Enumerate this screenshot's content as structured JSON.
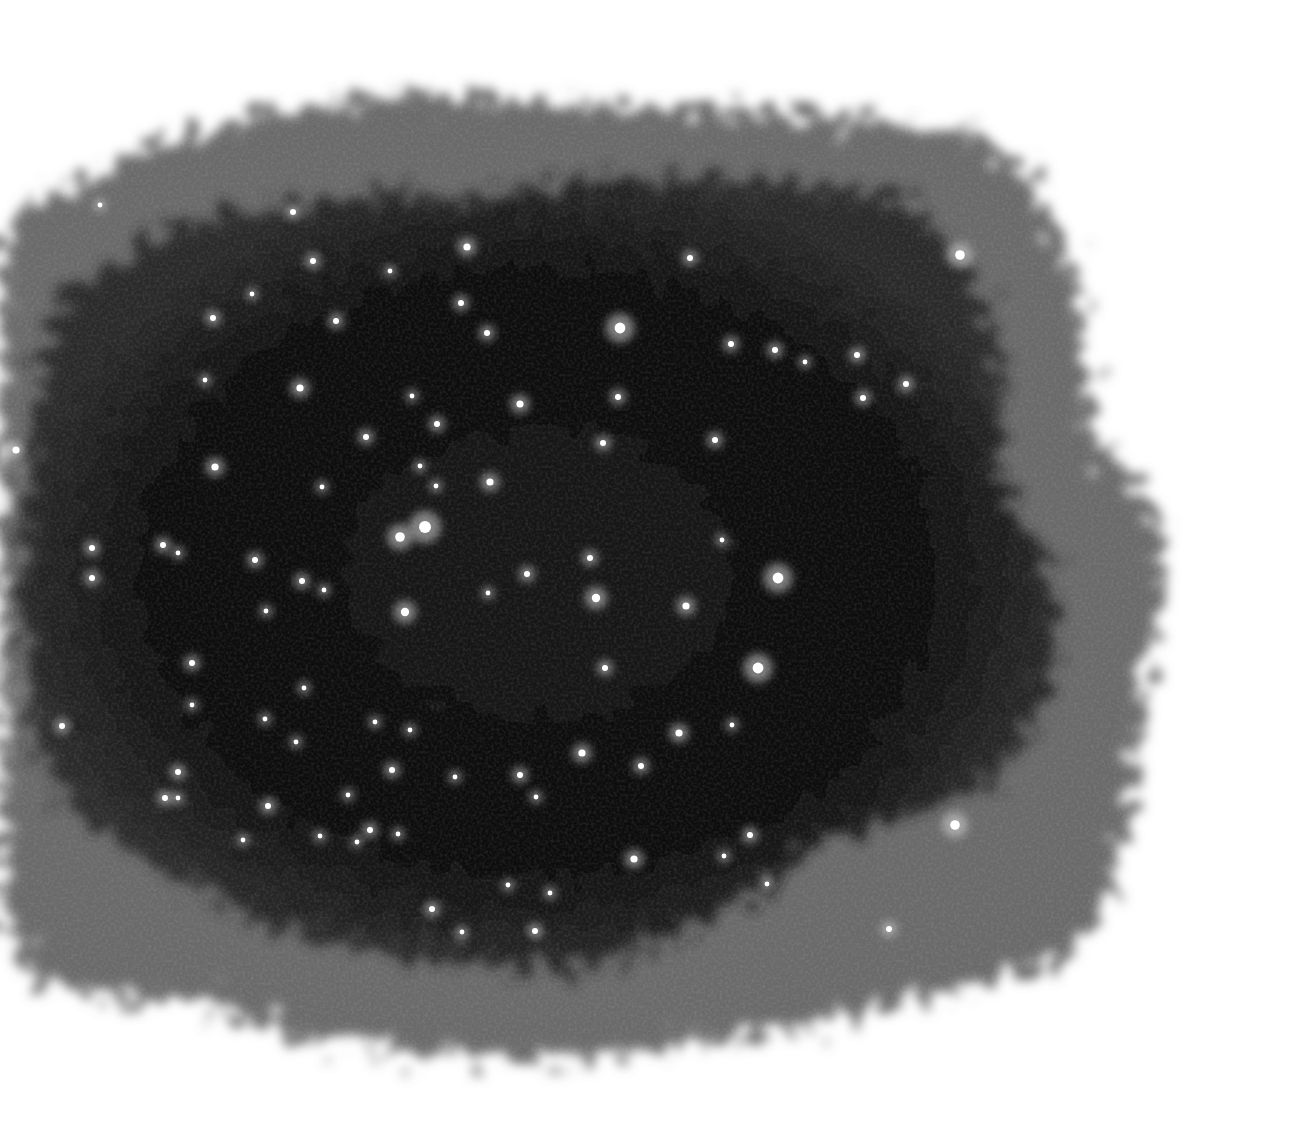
{
  "image": {
    "description": "Grayscale star field on a dark irregular patch with noisy feathered edges against white background",
    "background": "#ffffff",
    "field_color": "#0a0a0a",
    "edge_color": "#5a5a5a",
    "stars": [
      [
        620,
        328,
        9
      ],
      [
        690,
        258,
        5
      ],
      [
        960,
        255,
        8
      ],
      [
        778,
        578,
        9
      ],
      [
        758,
        668,
        9
      ],
      [
        955,
        825,
        8
      ],
      [
        425,
        527,
        10
      ],
      [
        400,
        537,
        8
      ],
      [
        405,
        612,
        7
      ],
      [
        596,
        598,
        7
      ],
      [
        686,
        606,
        6
      ],
      [
        582,
        753,
        6
      ],
      [
        520,
        404,
        6
      ],
      [
        437,
        424,
        5
      ],
      [
        412,
        396,
        4
      ],
      [
        366,
        437,
        5
      ],
      [
        300,
        388,
        6
      ],
      [
        215,
        467,
        6
      ],
      [
        213,
        318,
        5
      ],
      [
        313,
        261,
        5
      ],
      [
        336,
        321,
        5
      ],
      [
        252,
        294,
        4
      ],
      [
        390,
        271,
        4
      ],
      [
        293,
        212,
        5
      ],
      [
        467,
        247,
        6
      ],
      [
        461,
        303,
        5
      ],
      [
        487,
        333,
        5
      ],
      [
        490,
        482,
        6
      ],
      [
        436,
        486,
        4
      ],
      [
        420,
        466,
        4
      ],
      [
        322,
        487,
        4
      ],
      [
        163,
        545,
        5
      ],
      [
        178,
        553,
        4
      ],
      [
        92,
        548,
        5
      ],
      [
        92,
        578,
        5
      ],
      [
        255,
        560,
        5
      ],
      [
        302,
        581,
        5
      ],
      [
        324,
        590,
        4
      ],
      [
        266,
        611,
        4
      ],
      [
        192,
        663,
        5
      ],
      [
        192,
        705,
        4
      ],
      [
        304,
        688,
        4
      ],
      [
        265,
        719,
        4
      ],
      [
        296,
        742,
        4
      ],
      [
        62,
        726,
        5
      ],
      [
        178,
        772,
        5
      ],
      [
        165,
        798,
        5
      ],
      [
        178,
        798,
        4
      ],
      [
        268,
        806,
        5
      ],
      [
        243,
        840,
        4
      ],
      [
        320,
        836,
        4
      ],
      [
        370,
        830,
        5
      ],
      [
        357,
        842,
        4
      ],
      [
        398,
        834,
        4
      ],
      [
        392,
        770,
        5
      ],
      [
        410,
        730,
        4
      ],
      [
        375,
        722,
        4
      ],
      [
        348,
        795,
        4
      ],
      [
        455,
        777,
        4
      ],
      [
        520,
        775,
        5
      ],
      [
        536,
        797,
        4
      ],
      [
        527,
        574,
        5
      ],
      [
        590,
        558,
        5
      ],
      [
        603,
        443,
        5
      ],
      [
        618,
        397,
        5
      ],
      [
        715,
        440,
        5
      ],
      [
        731,
        344,
        5
      ],
      [
        775,
        350,
        5
      ],
      [
        805,
        362,
        4
      ],
      [
        857,
        355,
        5
      ],
      [
        863,
        398,
        5
      ],
      [
        906,
        384,
        5
      ],
      [
        722,
        540,
        4
      ],
      [
        605,
        668,
        5
      ],
      [
        679,
        733,
        6
      ],
      [
        641,
        766,
        5
      ],
      [
        732,
        725,
        4
      ],
      [
        750,
        835,
        5
      ],
      [
        724,
        856,
        4
      ],
      [
        767,
        884,
        4
      ],
      [
        634,
        859,
        6
      ],
      [
        535,
        931,
        5
      ],
      [
        508,
        885,
        4
      ],
      [
        550,
        893,
        4
      ],
      [
        432,
        909,
        5
      ],
      [
        462,
        932,
        4
      ],
      [
        889,
        929,
        5
      ],
      [
        16,
        450,
        6
      ],
      [
        100,
        205,
        4
      ],
      [
        205,
        380,
        4
      ],
      [
        488,
        593,
        4
      ]
    ]
  }
}
